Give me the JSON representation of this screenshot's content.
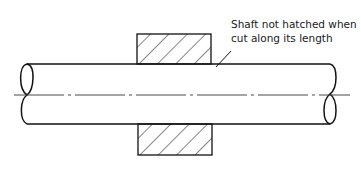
{
  "diagram": {
    "type": "engineering-section-drawing",
    "annotation": {
      "line1": "Shaft not hatched when",
      "line2": "cut along its length"
    },
    "elements": {
      "shaft": "solid shaft with break symbols at both ends",
      "hub": "sectioned hub, hatched at 45 degrees above and below shaft",
      "centerline": "chain line along shaft axis",
      "leader": "leader line from annotation to shaft"
    },
    "colors": {
      "line": "#111111",
      "background": "#ffffff",
      "centerline": "#333333"
    }
  }
}
